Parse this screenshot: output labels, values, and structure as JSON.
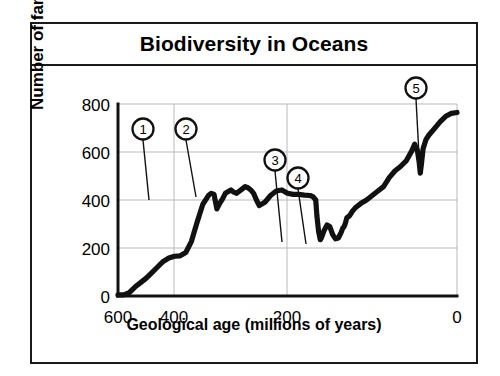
{
  "figure": {
    "title": "Biodiversity in Oceans"
  },
  "chart_data": {
    "type": "line",
    "title": "Biodiversity in Oceans",
    "xlabel": "Geological age (millions of years)",
    "ylabel": "Number of families",
    "xlim": [
      600,
      0
    ],
    "ylim": [
      -60,
      800
    ],
    "x_ticks": [
      "600",
      "400",
      "200",
      "0"
    ],
    "x_tick_values": [
      600,
      400,
      200,
      0
    ],
    "y_ticks": [
      "0",
      "200",
      "400",
      "600",
      "800"
    ],
    "y_tick_values": [
      0,
      200,
      400,
      600,
      800
    ],
    "x_axis_reversed": true,
    "grid": "horizontal and vertical gridlines at ticks",
    "legend": "none",
    "series": [
      {
        "name": "Number of marine families",
        "x": [
          600,
          590,
          580,
          570,
          560,
          550,
          540,
          530,
          520,
          510,
          500,
          490,
          480,
          470,
          460,
          450,
          440,
          435,
          430,
          425,
          420,
          415,
          410,
          400,
          395,
          390,
          380,
          375,
          370,
          365,
          360,
          355,
          350,
          340,
          330,
          320,
          310,
          300,
          290,
          280,
          270,
          260,
          255,
          250,
          248,
          245,
          242,
          240,
          235,
          230,
          225,
          220,
          215,
          210,
          205,
          202,
          200,
          198,
          195,
          190,
          185,
          180,
          170,
          160,
          150,
          140,
          130,
          120,
          110,
          100,
          90,
          80,
          75,
          70,
          67,
          65,
          63,
          60,
          55,
          50,
          40,
          30,
          20,
          10,
          0
        ],
        "y": [
          -55,
          -55,
          -45,
          -20,
          0,
          20,
          45,
          70,
          95,
          110,
          118,
          120,
          135,
          185,
          270,
          350,
          390,
          400,
          395,
          330,
          355,
          375,
          400,
          415,
          405,
          400,
          420,
          430,
          425,
          415,
          400,
          370,
          345,
          360,
          390,
          410,
          415,
          400,
          395,
          395,
          392,
          390,
          385,
          370,
          300,
          230,
          192,
          200,
          235,
          258,
          250,
          215,
          196,
          200,
          225,
          245,
          250,
          262,
          290,
          300,
          320,
          335,
          355,
          370,
          390,
          410,
          430,
          470,
          500,
          520,
          545,
          590,
          620,
          590,
          540,
          490,
          530,
          600,
          640,
          660,
          690,
          720,
          745,
          758,
          762
        ]
      }
    ],
    "annotations": [
      {
        "label": "1",
        "x": 425,
        "y": 330,
        "note": "late Ordovician dip"
      },
      {
        "label": "2",
        "x": 365,
        "y": 350,
        "note": "late Devonian dip"
      },
      {
        "label": "3",
        "x": 245,
        "y": 192,
        "note": "end-Permian dip"
      },
      {
        "label": "4",
        "x": 213,
        "y": 196,
        "note": "end-Triassic dip"
      },
      {
        "label": "5",
        "x": 66,
        "y": 490,
        "note": "end-Cretaceous dip"
      }
    ]
  }
}
